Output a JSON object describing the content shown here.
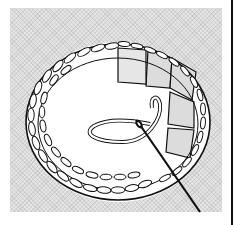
{
  "figure": {
    "alt": "Line illustration of a ring covered in buttonhole stitches, with fabric blocks on the right side and a threaded needle passing through the stitches",
    "colors": {
      "background": "#ffffff",
      "panel": "#e4e4e4",
      "line": "#111111",
      "fill": "#ffffff",
      "block": "#d9d9d9"
    }
  }
}
